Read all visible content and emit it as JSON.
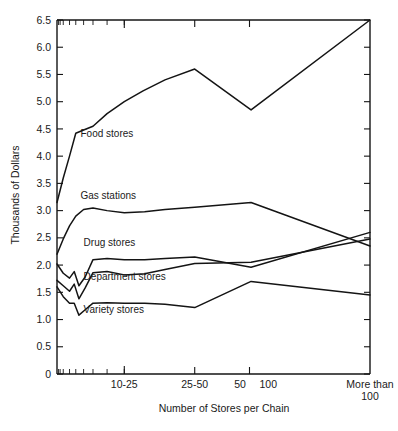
{
  "chart_data": {
    "type": "line",
    "title": "",
    "xlabel": "Number of Stores per Chain",
    "ylabel": "Thousands of Dollars",
    "ylim": [
      0,
      6.5
    ],
    "ytick_labels": [
      "0",
      "0.5",
      "1.0",
      "1.5",
      "2.0",
      "2.5",
      "3.0",
      "3.5",
      "4.0",
      "4.5",
      "5.0",
      "5.5",
      "6.0",
      "6.5"
    ],
    "ytick_values": [
      0,
      0.5,
      1.0,
      1.5,
      2.0,
      2.5,
      3.0,
      3.5,
      4.0,
      4.5,
      5.0,
      5.5,
      6.0,
      6.5
    ],
    "xtick_labels": [
      "10-25",
      "25-50",
      "50",
      "100",
      "More than 100"
    ],
    "xtick_positions": [
      0.215,
      0.44,
      0.615,
      0.655,
      1.0
    ],
    "grid": false,
    "legend_position": "inline-labels",
    "axis_style": "box",
    "series": [
      {
        "name": "Food stores",
        "label_x": 0.075,
        "label_y": 4.35,
        "x": [
          0.0,
          0.02,
          0.04,
          0.06,
          0.085,
          0.115,
          0.16,
          0.215,
          0.275,
          0.345,
          0.44,
          0.62,
          1.0
        ],
        "values": [
          3.15,
          3.6,
          4.0,
          4.42,
          4.48,
          4.55,
          4.78,
          5.0,
          5.2,
          5.4,
          5.6,
          4.85,
          6.5
        ]
      },
      {
        "name": "Gas stations",
        "label_x": 0.075,
        "label_y": 3.22,
        "x": [
          0.0,
          0.02,
          0.04,
          0.06,
          0.085,
          0.115,
          0.16,
          0.215,
          0.28,
          0.345,
          0.44,
          0.62,
          1.0
        ],
        "values": [
          2.2,
          2.48,
          2.72,
          2.9,
          3.02,
          3.05,
          3.0,
          2.96,
          2.98,
          3.02,
          3.06,
          3.15,
          2.35
        ]
      },
      {
        "name": "Drug stores",
        "label_x": 0.085,
        "label_y": 2.35,
        "x": [
          0.0,
          0.02,
          0.04,
          0.055,
          0.07,
          0.09,
          0.115,
          0.16,
          0.215,
          0.28,
          0.345,
          0.44,
          0.62,
          1.0
        ],
        "values": [
          2.02,
          1.85,
          1.76,
          1.88,
          1.62,
          1.78,
          2.1,
          2.12,
          2.1,
          2.1,
          2.12,
          2.15,
          1.96,
          2.6
        ]
      },
      {
        "name": "Department stores",
        "label_x": 0.085,
        "label_y": 1.72,
        "x": [
          0.0,
          0.02,
          0.04,
          0.055,
          0.07,
          0.09,
          0.115,
          0.16,
          0.215,
          0.28,
          0.345,
          0.44,
          0.62,
          1.0
        ],
        "values": [
          1.72,
          1.62,
          1.52,
          1.65,
          1.38,
          1.58,
          1.86,
          1.88,
          1.82,
          1.84,
          1.92,
          2.03,
          2.05,
          2.48
        ]
      },
      {
        "name": "Variety stores",
        "label_x": 0.085,
        "label_y": 1.12,
        "x": [
          0.0,
          0.02,
          0.04,
          0.055,
          0.07,
          0.09,
          0.115,
          0.16,
          0.215,
          0.28,
          0.345,
          0.44,
          0.62,
          1.0
        ],
        "values": [
          1.6,
          1.42,
          1.3,
          1.3,
          1.08,
          1.18,
          1.3,
          1.31,
          1.3,
          1.3,
          1.28,
          1.22,
          1.7,
          1.45
        ]
      }
    ],
    "minor_tick_fraction": [
      0.02,
      0.04,
      0.06,
      0.085,
      0.115,
      0.16,
      0.215
    ],
    "minor_tick_count_left": 9
  }
}
